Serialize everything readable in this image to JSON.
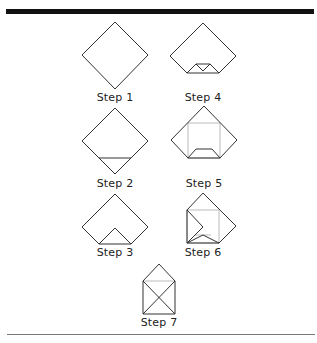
{
  "colors": {
    "stroke": "#333333",
    "guide": "#bbbbbb",
    "top_bar": "#111111",
    "bottom_rule": "#777777"
  },
  "steps": [
    {
      "label": "Step 1"
    },
    {
      "label": "Step 2"
    },
    {
      "label": "Step 3"
    },
    {
      "label": "Step 4"
    },
    {
      "label": "Step 5"
    },
    {
      "label": "Step 6"
    },
    {
      "label": "Step 7"
    }
  ]
}
